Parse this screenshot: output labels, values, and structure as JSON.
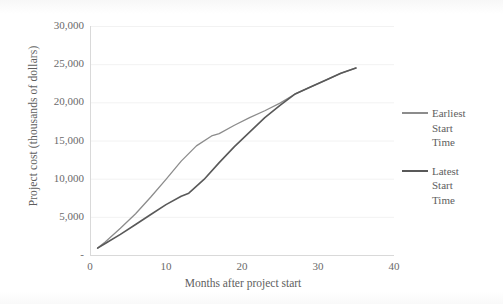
{
  "chart_data": {
    "type": "line",
    "title": "",
    "xlabel": "Months after project start",
    "ylabel": "Project cost (thousands of dollars)",
    "xlim": [
      0,
      40
    ],
    "ylim": [
      0,
      30000
    ],
    "xticks": [
      "0",
      "10",
      "20",
      "30",
      "40"
    ],
    "xtick_values": [
      0,
      10,
      20,
      30,
      40
    ],
    "yticks": [
      "-",
      "5,000",
      "10,000",
      "15,000",
      "20,000",
      "25,000",
      "30,000"
    ],
    "ytick_values": [
      0,
      5000,
      10000,
      15000,
      20000,
      25000,
      30000
    ],
    "grid": "horizontal",
    "legend_position": "right",
    "series": [
      {
        "name": "Earliest Start Time",
        "color": "#8c8c8c",
        "x": [
          1,
          2,
          4,
          6,
          8,
          10,
          12,
          14,
          16,
          17,
          19,
          21,
          23,
          25,
          27,
          29,
          31,
          33,
          35
        ],
        "values": [
          900,
          1700,
          3500,
          5400,
          7600,
          9900,
          12300,
          14300,
          15600,
          15900,
          17000,
          18000,
          18900,
          19900,
          21100,
          22000,
          22900,
          23800,
          24500
        ]
      },
      {
        "name": "Latest Start Time",
        "color": "#595959",
        "x": [
          1,
          2,
          4,
          6,
          8,
          10,
          12,
          13,
          15,
          17,
          19,
          21,
          23,
          25,
          27,
          29,
          31,
          33,
          35
        ],
        "values": [
          900,
          1500,
          2700,
          4000,
          5300,
          6600,
          7700,
          8100,
          9900,
          12100,
          14200,
          16100,
          18000,
          19600,
          21100,
          22000,
          22900,
          23800,
          24500
        ]
      }
    ]
  },
  "legend": {
    "items": [
      {
        "label": "Earliest Start Time",
        "lines": [
          "Earliest",
          "Start",
          "Time"
        ],
        "color": "#8c8c8c"
      },
      {
        "label": "Latest Start Time",
        "lines": [
          "Latest",
          "Start",
          "Time"
        ],
        "color": "#595959"
      }
    ]
  },
  "colors": {
    "series_light": "#8c8c8c",
    "series_dark": "#595959",
    "axis": "#d9d9d9",
    "gridline": "#f2f2f2",
    "text": "#5e5e5e"
  }
}
